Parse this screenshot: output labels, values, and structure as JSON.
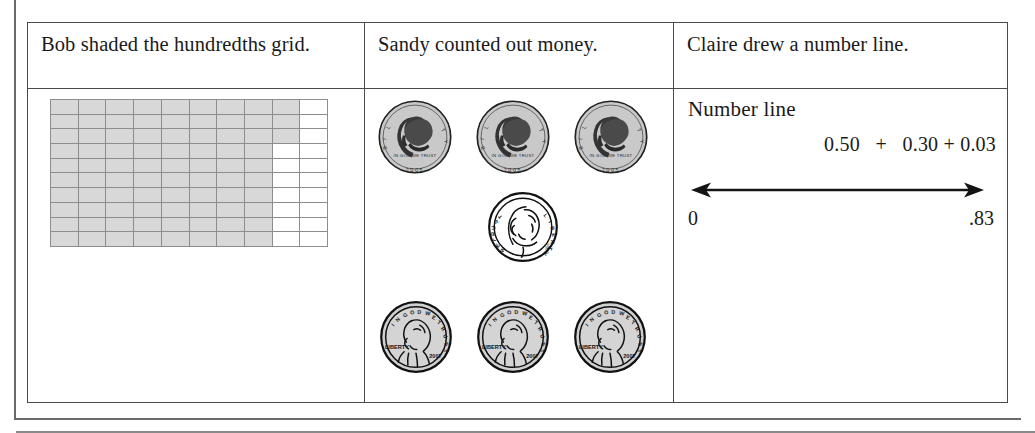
{
  "table": {
    "headers": [
      "Bob shaded the hundredths grid.",
      "Sandy counted out money.",
      "Claire drew a number line."
    ]
  },
  "grid": {
    "rows": 10,
    "cols": 10,
    "shaded_count": 83,
    "shaded_value": ".83",
    "shade_color": "#d8d8d8",
    "line_color": "#8d8d8d",
    "shaded_per_row": [
      9,
      9,
      9,
      8,
      8,
      8,
      8,
      8,
      8,
      8
    ]
  },
  "money": {
    "coins": [
      {
        "name": "half-dollar",
        "label_liberty": "LIBERTY",
        "label_motto": "IN GOD WE TRUST",
        "year": "2005",
        "value": "0.50",
        "count": 3
      },
      {
        "name": "dime",
        "label_liberty": "LIBERTY",
        "label_motto": "IN GOD WE TRUST",
        "year": "2002",
        "value": "0.10",
        "count": 1
      },
      {
        "name": "penny",
        "label_liberty": "LIBERTY",
        "label_motto": "IN GOD WE TRUST",
        "year": "2007",
        "value": "0.01",
        "count": 3
      }
    ]
  },
  "number_line": {
    "title": "Number line",
    "expression": "0.50   +   0.30 + 0.03",
    "left_label": "0",
    "right_label": ".83"
  }
}
